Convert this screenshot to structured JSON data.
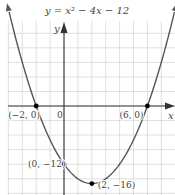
{
  "chart_data": {
    "type": "line",
    "title": "y = x² − 4x − 12",
    "xlabel": "x",
    "ylabel": "y",
    "function": {
      "a": 1,
      "b": -4,
      "c": -12
    },
    "xlim": [
      -4,
      8
    ],
    "ylim": [
      -18,
      12
    ],
    "x_grid_step": 1,
    "y_grid_step": 3,
    "grid": true,
    "origin_label": "0",
    "points": [
      {
        "x": -2,
        "y": 0,
        "label": "(−2, 0)"
      },
      {
        "x": 6,
        "y": 0,
        "label": "(6, 0)"
      },
      {
        "x": 0,
        "y": -12,
        "label": "(0, −12)"
      },
      {
        "x": 2,
        "y": -16,
        "label": "(2, −16)"
      }
    ],
    "colors": {
      "curve": "#555555",
      "axis": "#333333",
      "grid": "#d8d8d8",
      "point": "#000000"
    }
  }
}
